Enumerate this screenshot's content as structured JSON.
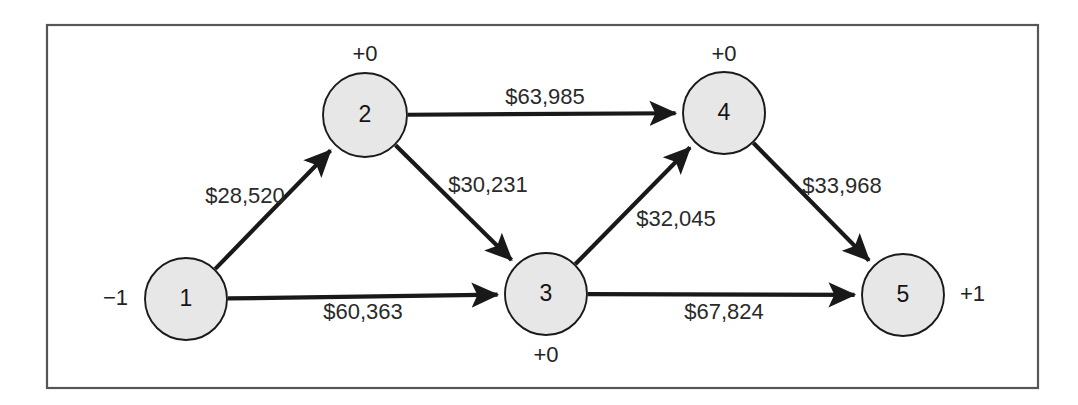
{
  "figure": {
    "type": "minimum-cost-network-flow-diagram",
    "frame": {
      "x": 47,
      "y": 25,
      "width": 991,
      "height": 363
    },
    "colors": {
      "node_fill": "#e7e7e7",
      "node_stroke": "#1a1a1a",
      "edge_stroke": "#191919",
      "frame_stroke": "#55555a",
      "text": "#2a2a2a",
      "background": "#ffffff"
    }
  },
  "nodes": [
    {
      "id": "1",
      "label": "1",
      "supply": "−1",
      "supply_position": "left",
      "cx": 186,
      "cy": 299,
      "r": 41,
      "supply_x": 128,
      "supply_y": 299
    },
    {
      "id": "2",
      "label": "2",
      "supply": "+0",
      "supply_position": "above",
      "cx": 365,
      "cy": 115,
      "r": 42,
      "supply_x": 365,
      "supply_y": 55
    },
    {
      "id": "3",
      "label": "3",
      "supply": "+0",
      "supply_position": "below",
      "cx": 546,
      "cy": 294,
      "r": 41,
      "supply_x": 546,
      "supply_y": 356
    },
    {
      "id": "4",
      "label": "4",
      "supply": "+0",
      "supply_position": "above",
      "cx": 724,
      "cy": 113,
      "r": 41,
      "supply_x": 724,
      "supply_y": 55
    },
    {
      "id": "5",
      "label": "5",
      "supply": "+1",
      "supply_position": "right",
      "cx": 903,
      "cy": 295,
      "r": 41,
      "supply_x": 960,
      "supply_y": 295
    }
  ],
  "edges": [
    {
      "id": "edge-1-2",
      "from": "1",
      "to": "2",
      "cost": "$28,520",
      "label_x": 245,
      "label_y": 197,
      "label_anchor": "middle"
    },
    {
      "id": "edge-1-3",
      "from": "1",
      "to": "3",
      "cost": "$60,363",
      "label_x": 363,
      "label_y": 313,
      "label_anchor": "middle"
    },
    {
      "id": "edge-2-4",
      "from": "2",
      "to": "4",
      "cost": "$63,985",
      "label_x": 545,
      "label_y": 98,
      "label_anchor": "middle"
    },
    {
      "id": "edge-2-3",
      "from": "2",
      "to": "3",
      "cost": "$30,231",
      "label_x": 488,
      "label_y": 186,
      "label_anchor": "middle"
    },
    {
      "id": "edge-3-4",
      "from": "3",
      "to": "4",
      "cost": "$32,045",
      "label_x": 676,
      "label_y": 220,
      "label_anchor": "middle"
    },
    {
      "id": "edge-4-5",
      "from": "4",
      "to": "5",
      "cost": "$33,968",
      "label_x": 842,
      "label_y": 187,
      "label_anchor": "middle"
    },
    {
      "id": "edge-3-5",
      "from": "3",
      "to": "5",
      "cost": "$67,824",
      "label_x": 724,
      "label_y": 313,
      "label_anchor": "middle"
    }
  ]
}
